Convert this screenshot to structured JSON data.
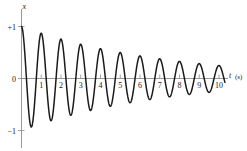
{
  "figure": {
    "background_color": "#ffffff",
    "width": 247,
    "height": 151
  },
  "axes": {
    "y_axis_label": "x",
    "x_axis_label": "t",
    "x_axis_unit": "(s)",
    "axis_color": "#8c8c8c",
    "curve_color": "#1a1a1a"
  },
  "ticks": {
    "y": [
      {
        "label": "+1",
        "value": 1
      },
      {
        "label": "0",
        "value": 0
      },
      {
        "label": "−1",
        "value": -1
      }
    ],
    "x": [
      {
        "label": "1",
        "value": 1
      },
      {
        "label": "2",
        "value": 2
      },
      {
        "label": "3",
        "value": 3
      },
      {
        "label": "4",
        "value": 4
      },
      {
        "label": "5",
        "value": 5
      },
      {
        "label": "6",
        "value": 6
      },
      {
        "label": "7",
        "value": 7
      },
      {
        "label": "8",
        "value": 8
      },
      {
        "label": "9",
        "value": 9
      },
      {
        "label": "10",
        "value": 10
      }
    ]
  },
  "chart_data": {
    "type": "line",
    "title": "",
    "subtitle": "",
    "xlabel": "t (s)",
    "ylabel": "x",
    "xlim": [
      0,
      10.35
    ],
    "ylim": [
      -1.18,
      1.15
    ],
    "grid": false,
    "legend": null,
    "model": {
      "function": "x(t) = A0 * exp(-t/tau) * cos(2*pi*t/T)",
      "A0": 1.0,
      "tau": 7.2,
      "T": 1.0,
      "phase": 0
    },
    "x_tick_values": [
      1,
      2,
      3,
      4,
      5,
      6,
      7,
      8,
      9,
      10
    ],
    "y_tick_values": [
      -1,
      0,
      1
    ],
    "envelope_peaks": [
      {
        "t": 0.0,
        "x": 1.0
      },
      {
        "t": 1.0,
        "x": 0.87
      },
      {
        "t": 2.0,
        "x": 0.76
      },
      {
        "t": 3.0,
        "x": 0.66
      },
      {
        "t": 4.0,
        "x": 0.57
      },
      {
        "t": 5.0,
        "x": 0.5
      },
      {
        "t": 6.0,
        "x": 0.44
      },
      {
        "t": 7.0,
        "x": 0.38
      },
      {
        "t": 8.0,
        "x": 0.33
      },
      {
        "t": 9.0,
        "x": 0.29
      },
      {
        "t": 10.0,
        "x": 0.25
      }
    ],
    "envelope_troughs": [
      {
        "t": 0.5,
        "x": -0.93
      },
      {
        "t": 1.5,
        "x": -0.81
      },
      {
        "t": 2.5,
        "x": -0.71
      },
      {
        "t": 3.5,
        "x": -0.61
      },
      {
        "t": 4.5,
        "x": -0.54
      },
      {
        "t": 5.5,
        "x": -0.47
      },
      {
        "t": 6.5,
        "x": -0.41
      },
      {
        "t": 7.5,
        "x": -0.35
      },
      {
        "t": 8.5,
        "x": -0.31
      },
      {
        "t": 9.5,
        "x": -0.27
      }
    ]
  }
}
